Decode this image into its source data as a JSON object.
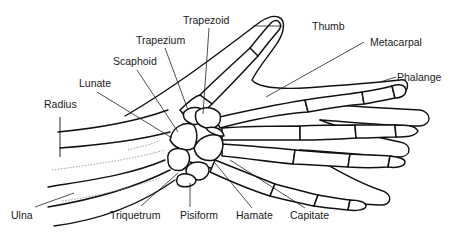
{
  "diagram": {
    "labels": {
      "trapezoid": "Trapezoid",
      "thumb": "Thumb",
      "trapezium": "Trapezium",
      "metacarpal": "Metacarpal",
      "scaphoid": "Scaphoid",
      "phalange": "Phalange",
      "lunate": "Lunate",
      "radius": "Radius",
      "ulna": "Ulna",
      "triquetrum": "Triquetrum",
      "pisiform": "Pisiform",
      "hamate": "Hamate",
      "capitate": "Capitate"
    },
    "colors": {
      "line": "#111111",
      "background": "#ffffff",
      "dotted": "#888888"
    }
  }
}
